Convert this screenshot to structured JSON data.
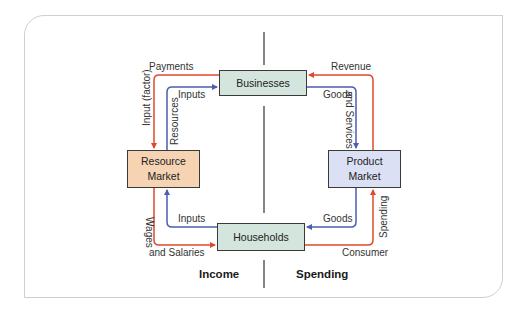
{
  "diagram": {
    "type": "circular-flow",
    "colors": {
      "money_flow": "#e04a2a",
      "goods_flow": "#4b5fae",
      "businesses_fill": "#d3e5dc",
      "households_fill": "#d3e5dc",
      "resource_market_fill": "#f5d3b3",
      "product_market_fill": "#dbe0f5",
      "divider": "#333333"
    },
    "nodes": {
      "businesses": "Businesses",
      "households": "Households",
      "resource_market_line1": "Resource",
      "resource_market_line2": "Market",
      "product_market_line1": "Product",
      "product_market_line2": "Market"
    },
    "flow_labels": {
      "payments": "Payments",
      "input_factor": "Input (factor)",
      "inputs_top": "Inputs",
      "resources": "Resources",
      "revenue": "Revenue",
      "goods_top": "Goods",
      "and_services": "and Services",
      "wages": "Wages",
      "and_salaries": "and Salaries",
      "inputs_bottom": "Inputs",
      "goods_bottom": "Goods",
      "spending_vertical": "Spending",
      "consumer": "Consumer"
    },
    "sections": {
      "left": "Income",
      "right": "Spending"
    },
    "edges": [
      {
        "from": "Businesses",
        "to": "Resource Market",
        "label": "Payments / Input (factor)",
        "kind": "money"
      },
      {
        "from": "Resource Market",
        "to": "Businesses",
        "label": "Inputs / Resources",
        "kind": "goods"
      },
      {
        "from": "Product Market",
        "to": "Businesses",
        "label": "Revenue",
        "kind": "money"
      },
      {
        "from": "Businesses",
        "to": "Product Market",
        "label": "Goods and Services",
        "kind": "goods"
      },
      {
        "from": "Resource Market",
        "to": "Households",
        "label": "Wages and Salaries",
        "kind": "money"
      },
      {
        "from": "Households",
        "to": "Resource Market",
        "label": "Inputs",
        "kind": "goods"
      },
      {
        "from": "Product Market",
        "to": "Households",
        "label": "Goods",
        "kind": "goods"
      },
      {
        "from": "Households",
        "to": "Product Market",
        "label": "Consumer Spending",
        "kind": "money"
      }
    ]
  }
}
